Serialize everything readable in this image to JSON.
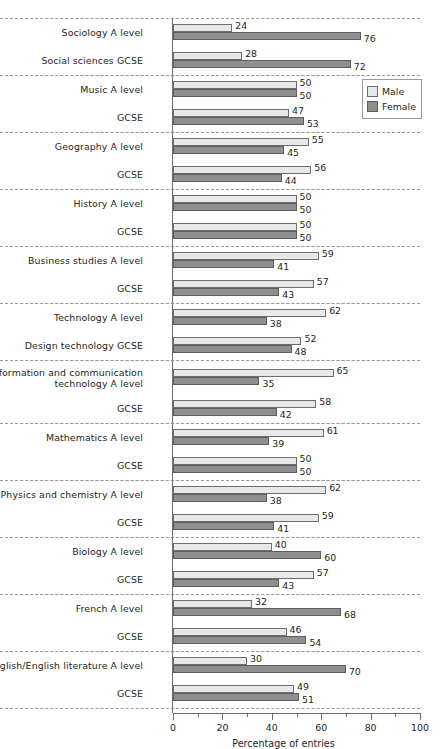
{
  "chart_data": {
    "type": "bar",
    "orientation": "horizontal",
    "title": "",
    "xlabel": "Percentage of entries",
    "ylabel": "",
    "xlim": [
      0,
      100
    ],
    "xticks": [
      0,
      20,
      40,
      60,
      80,
      100
    ],
    "xtick_labels": [
      "0",
      "20",
      "40",
      "60",
      "80",
      "100"
    ],
    "minor_tick_step": 10,
    "grid": false,
    "legend_position": "upper right",
    "series": [
      {
        "name": "Male",
        "color": "#e8e8e8"
      },
      {
        "name": "Female",
        "color": "#8f8f8f"
      }
    ],
    "categories": [
      "Sociology A level",
      "Social sciences GCSE",
      "Music A level",
      "GCSE",
      "Geography A level",
      "GCSE",
      "History A level",
      "GCSE",
      "Business studies A level",
      "GCSE",
      "Technology A level",
      "Design technology GCSE",
      "Information and communication\ntechnology A level",
      "GCSE",
      "Mathematics A level",
      "GCSE",
      "Physics and chemistry A level",
      "GCSE",
      "Biology A level",
      "GCSE",
      "French A level",
      "GCSE",
      "English/English literature A level",
      "GCSE"
    ],
    "male": [
      24,
      28,
      50,
      47,
      55,
      56,
      50,
      50,
      59,
      57,
      62,
      52,
      65,
      58,
      61,
      50,
      62,
      59,
      40,
      57,
      32,
      46,
      30,
      49
    ],
    "female": [
      76,
      72,
      50,
      53,
      45,
      44,
      50,
      50,
      41,
      43,
      38,
      48,
      35,
      42,
      39,
      50,
      38,
      41,
      60,
      43,
      68,
      54,
      70,
      51
    ]
  },
  "groups": [
    {
      "tall": false,
      "rows": [
        {
          "label": "Sociology A level",
          "male": 24,
          "female": 76
        },
        {
          "label": "Social sciences GCSE",
          "male": 28,
          "female": 72
        }
      ]
    },
    {
      "tall": false,
      "rows": [
        {
          "label": "Music A level",
          "male": 50,
          "female": 50
        },
        {
          "label": "GCSE",
          "male": 47,
          "female": 53
        }
      ]
    },
    {
      "tall": false,
      "rows": [
        {
          "label": "Geography A level",
          "male": 55,
          "female": 45
        },
        {
          "label": "GCSE",
          "male": 56,
          "female": 44
        }
      ]
    },
    {
      "tall": false,
      "rows": [
        {
          "label": "History A level",
          "male": 50,
          "female": 50
        },
        {
          "label": "GCSE",
          "male": 50,
          "female": 50
        }
      ]
    },
    {
      "tall": false,
      "rows": [
        {
          "label": "Business studies A level",
          "male": 59,
          "female": 41
        },
        {
          "label": "GCSE",
          "male": 57,
          "female": 43
        }
      ]
    },
    {
      "tall": false,
      "rows": [
        {
          "label": "Technology A level",
          "male": 62,
          "female": 38
        },
        {
          "label": "Design technology GCSE",
          "male": 52,
          "female": 48
        }
      ]
    },
    {
      "tall": true,
      "rows": [
        {
          "label": "Information and communication\ntechnology A level",
          "male": 65,
          "female": 35
        },
        {
          "label": "GCSE",
          "male": 58,
          "female": 42
        }
      ]
    },
    {
      "tall": false,
      "rows": [
        {
          "label": "Mathematics A level",
          "male": 61,
          "female": 39
        },
        {
          "label": "GCSE",
          "male": 50,
          "female": 50
        }
      ]
    },
    {
      "tall": false,
      "rows": [
        {
          "label": "Physics and chemistry A level",
          "male": 62,
          "female": 38
        },
        {
          "label": "GCSE",
          "male": 59,
          "female": 41
        }
      ]
    },
    {
      "tall": false,
      "rows": [
        {
          "label": "Biology A level",
          "male": 40,
          "female": 60
        },
        {
          "label": "GCSE",
          "male": 57,
          "female": 43
        }
      ]
    },
    {
      "tall": false,
      "rows": [
        {
          "label": "French A level",
          "male": 32,
          "female": 68
        },
        {
          "label": "GCSE",
          "male": 46,
          "female": 54
        }
      ]
    },
    {
      "tall": false,
      "rows": [
        {
          "label": "English/English literature A level",
          "male": 30,
          "female": 70
        },
        {
          "label": "GCSE",
          "male": 49,
          "female": 51
        }
      ]
    }
  ],
  "axis": {
    "title": "Percentage of entries",
    "ticks": [
      "0",
      "20",
      "40",
      "60",
      "80",
      "100"
    ]
  },
  "legend": {
    "items": [
      {
        "label": "Male",
        "color": "#e8e8e8"
      },
      {
        "label": "Female",
        "color": "#8f8f8f"
      }
    ]
  }
}
